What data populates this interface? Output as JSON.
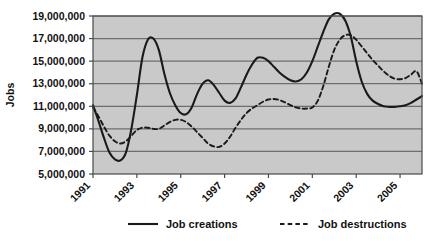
{
  "chart_data": {
    "type": "line",
    "title": "",
    "xlabel": "",
    "ylabel": "Jobs",
    "ylim": [
      5000000,
      19000000
    ],
    "ytick_labels": [
      "19,000,000",
      "17,000,000",
      "15,000,000",
      "13,000,000",
      "11,000,000",
      "9,000,000",
      "7,000,000",
      "5,000,000"
    ],
    "ytick_values": [
      19000000,
      17000000,
      15000000,
      13000000,
      11000000,
      9000000,
      7000000,
      5000000
    ],
    "xtick_labels": [
      "1991",
      "1993",
      "1995",
      "1997",
      "1999",
      "2001",
      "2003",
      "2005"
    ],
    "xtick_values": [
      1991,
      1993,
      1995,
      1997,
      1999,
      2001,
      2003,
      2005
    ],
    "xlim": [
      1991,
      2006
    ],
    "grid": true,
    "legend_position": "bottom",
    "plot_background": "#c9c9c9",
    "grid_color": "#6e6e6e",
    "line_color": "#1a1a1a",
    "x": [
      1991,
      1991.25,
      1991.5,
      1991.75,
      1992,
      1992.25,
      1992.5,
      1992.75,
      1993,
      1993.25,
      1993.5,
      1993.75,
      1994,
      1994.25,
      1994.5,
      1994.75,
      1995,
      1995.25,
      1995.5,
      1995.75,
      1996,
      1996.25,
      1996.5,
      1996.75,
      1997,
      1997.25,
      1997.5,
      1997.75,
      1998,
      1998.25,
      1998.5,
      1998.75,
      1999,
      1999.25,
      1999.5,
      1999.75,
      2000,
      2000.25,
      2000.5,
      2000.75,
      2001,
      2001.25,
      2001.5,
      2001.75,
      2002,
      2002.25,
      2002.5,
      2002.75,
      2003,
      2003.25,
      2003.5,
      2003.75,
      2004,
      2004.25,
      2004.5,
      2004.75,
      2005,
      2005.25,
      2005.5,
      2005.75,
      2006
    ],
    "series": [
      {
        "name": "Job creations",
        "style": "solid",
        "values": [
          11100000,
          9700000,
          8200000,
          6900000,
          6300000,
          6200000,
          6900000,
          9000000,
          12000000,
          15300000,
          16900000,
          17000000,
          16000000,
          13900000,
          12200000,
          11100000,
          10400000,
          10300000,
          10900000,
          12100000,
          13000000,
          13300000,
          12900000,
          12200000,
          11500000,
          11300000,
          11700000,
          12700000,
          13800000,
          14700000,
          15300000,
          15300000,
          15000000,
          14500000,
          14000000,
          13600000,
          13300000,
          13200000,
          13400000,
          14000000,
          15000000,
          16300000,
          17600000,
          18700000,
          19200000,
          19200000,
          18600000,
          17200000,
          15000000,
          13200000,
          12100000,
          11500000,
          11200000,
          11000000,
          10950000,
          10950000,
          11000000,
          11100000,
          11300000,
          11600000,
          11900000
        ]
      },
      {
        "name": "Job destructions",
        "style": "dashed",
        "values": [
          10900000,
          10100000,
          9200000,
          8400000,
          7900000,
          7700000,
          7900000,
          8400000,
          8900000,
          9100000,
          9100000,
          9000000,
          9000000,
          9300000,
          9600000,
          9800000,
          9800000,
          9600000,
          9200000,
          8700000,
          8200000,
          7700000,
          7450000,
          7400000,
          7700000,
          8300000,
          9100000,
          9800000,
          10400000,
          10800000,
          11100000,
          11400000,
          11600000,
          11650000,
          11550000,
          11350000,
          11100000,
          10900000,
          10800000,
          10800000,
          10900000,
          11500000,
          12800000,
          14500000,
          16000000,
          16900000,
          17300000,
          17300000,
          16900000,
          16300000,
          15700000,
          15100000,
          14600000,
          14100000,
          13700000,
          13450000,
          13400000,
          13500000,
          13800000,
          14100000,
          13000000
        ]
      }
    ],
    "legend": [
      {
        "label": "Job creations",
        "style": "solid"
      },
      {
        "label": "Job destructions",
        "style": "dashed"
      }
    ]
  }
}
